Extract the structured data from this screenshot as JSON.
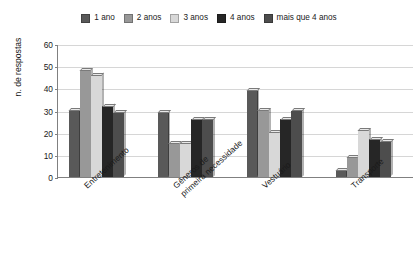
{
  "chart_data": {
    "type": "bar",
    "title": "",
    "xlabel": "",
    "ylabel": "n. de respostas",
    "ylim": [
      0,
      60
    ],
    "ytick_values": [
      0,
      10,
      20,
      30,
      40,
      50,
      60
    ],
    "ytick_labels": [
      "0",
      "10",
      "20",
      "30",
      "40",
      "50",
      "60"
    ],
    "grid": true,
    "legend_position": "top",
    "categories": [
      "Entretenimento",
      "Gêneros de primeira necessidade",
      "Vestuário",
      "Transporte"
    ],
    "category_lines": [
      [
        "Entretenimento"
      ],
      [
        "Gêneros de",
        "primeira necessidade"
      ],
      [
        "Vestuário"
      ],
      [
        "Transporte"
      ]
    ],
    "series": [
      {
        "name": "1 ano",
        "color": "#595959",
        "values": [
          30,
          29,
          39,
          3
        ]
      },
      {
        "name": "2 anos",
        "color": "#989898",
        "values": [
          48,
          15,
          30,
          9
        ]
      },
      {
        "name": "3 anos",
        "color": "#d8d8d8",
        "values": [
          46,
          15,
          20,
          21
        ]
      },
      {
        "name": "4 anos",
        "color": "#262626",
        "values": [
          32,
          26,
          26,
          17
        ]
      },
      {
        "name": "mais que 4 anos",
        "color": "#4d4d4d",
        "values": [
          29,
          26,
          30,
          16
        ]
      }
    ]
  },
  "legend": {
    "items": [
      {
        "label": "1 ano"
      },
      {
        "label": "2 anos"
      },
      {
        "label": "3 anos"
      },
      {
        "label": "4 anos"
      },
      {
        "label": "mais que 4 anos"
      }
    ]
  }
}
